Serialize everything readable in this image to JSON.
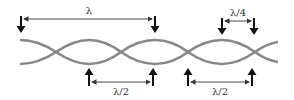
{
  "figure": {
    "colors": {
      "wave": "#888888",
      "arrow": "#111111",
      "dim_line": "#333333",
      "background": "#ffffff"
    }
  },
  "labels": {
    "wavelength": "λ",
    "quarter_wavelength": "λ/4",
    "half_wavelength_left": "λ/2",
    "half_wavelength_right": "λ/2"
  },
  "annotations": [
    {
      "id": "lambda",
      "label": "λ",
      "position": "top",
      "from_x": 21,
      "to_x": 155
    },
    {
      "id": "lambda-quarter",
      "label": "λ/4",
      "position": "top",
      "from_x": 222,
      "to_x": 254
    },
    {
      "id": "lambda-half-1",
      "label": "λ/2",
      "position": "bottom",
      "from_x": 89,
      "to_x": 153
    },
    {
      "id": "lambda-half-2",
      "label": "λ/2",
      "position": "bottom",
      "from_x": 188,
      "to_x": 252
    }
  ]
}
